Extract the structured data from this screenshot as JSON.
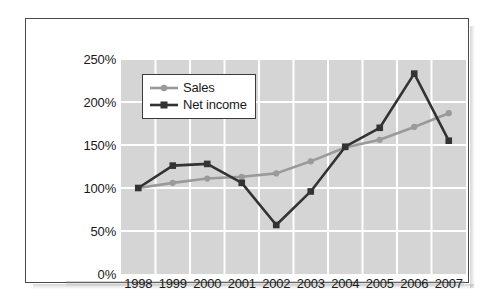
{
  "chart_data": {
    "type": "line",
    "title": "",
    "subtitle": "",
    "xlabel": "",
    "ylabel": "",
    "categories": [
      "1998",
      "1999",
      "2000",
      "2001",
      "2002",
      "2003",
      "2004",
      "2005",
      "2006",
      "2007"
    ],
    "ylim": [
      0,
      250
    ],
    "yticks": [
      0,
      50,
      100,
      150,
      200,
      250
    ],
    "ytick_labels": [
      "0%",
      "50%",
      "100%",
      "150%",
      "200%",
      "250%"
    ],
    "grid": true,
    "grid_color": "#ffffff",
    "plot_background": "#d5d5d5",
    "legend_position": "upper-left",
    "series": [
      {
        "name": "Sales",
        "color": "#9a9a9a",
        "marker": "circle",
        "values": [
          100,
          106,
          111,
          113,
          117,
          131,
          147,
          156,
          171,
          187
        ]
      },
      {
        "name": "Net income",
        "color": "#333333",
        "marker": "square",
        "values": [
          100,
          126,
          128,
          106,
          57,
          96,
          148,
          170,
          233,
          155
        ]
      }
    ]
  },
  "legend": {
    "items": [
      {
        "label": "Sales"
      },
      {
        "label": "Net income"
      }
    ]
  },
  "colors": {
    "sales": "#9a9a9a",
    "net_income": "#333333",
    "plot_bg": "#d5d5d5",
    "grid": "#ffffff",
    "frame": "#4a4a4a",
    "text": "#1a1a1a"
  }
}
